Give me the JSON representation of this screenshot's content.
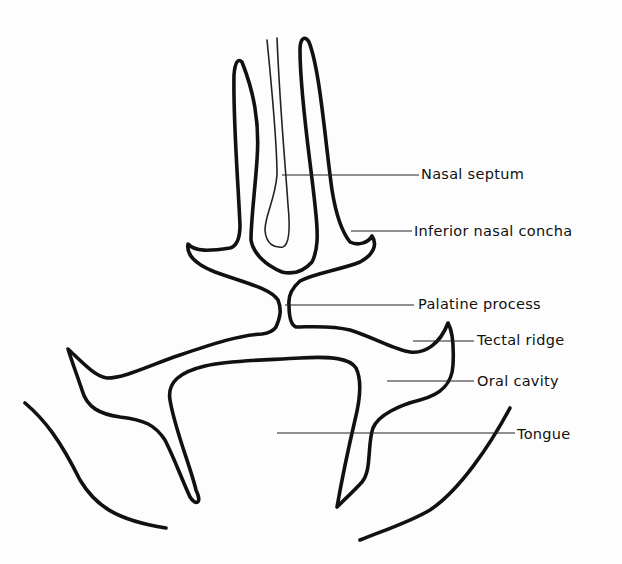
{
  "diagram": {
    "type": "anatomical cross-section line drawing",
    "labels": [
      {
        "id": "nasal-septum",
        "text": "Nasal septum"
      },
      {
        "id": "inferior-nasal-concha",
        "text": "Inferior nasal concha"
      },
      {
        "id": "palatine-process",
        "text": "Palatine process"
      },
      {
        "id": "tectal-ridge",
        "text": "Tectal ridge"
      },
      {
        "id": "oral-cavity",
        "text": "Oral cavity"
      },
      {
        "id": "tongue",
        "text": "Tongue"
      }
    ]
  }
}
